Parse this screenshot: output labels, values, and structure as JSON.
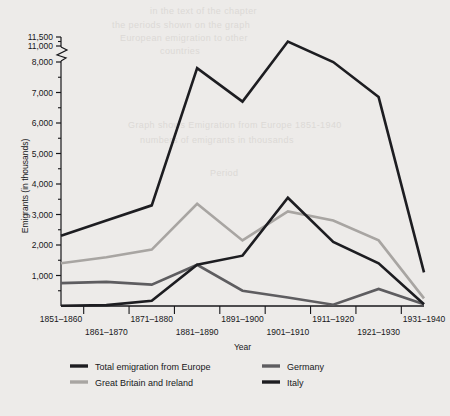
{
  "figure": {
    "background_color": "#edebe9",
    "plot_background_color": "#edebe9",
    "axis_color": "#17171a",
    "text_color": "#17171a"
  },
  "bleed_text": {
    "line1": "in the text of the chapter",
    "line2": "the periods shown on the graph",
    "line3": "European emigration to other",
    "line4": "countries",
    "line5": "Graph shows Emigration from Europe 1851-1940",
    "line6": "numbers of emigrants in thousands",
    "line7": "Period"
  },
  "chart_data": {
    "type": "line",
    "title": "",
    "xlabel": "Year",
    "ylabel": "Emigrants (in thousands)",
    "grid": false,
    "legend_position": "bottom",
    "axis_break": {
      "present": true,
      "between": [
        11000,
        8000
      ],
      "note": "y-axis is broken between 8,000 and 11,000"
    },
    "ylim": [
      0,
      11500
    ],
    "ytick_labels": [
      "1,000",
      "2,000",
      "3,000",
      "4,000",
      "5,000",
      "6,000",
      "7,000",
      "8,000",
      "11,000",
      "11,500"
    ],
    "ytick_values": [
      1000,
      2000,
      3000,
      4000,
      5000,
      6000,
      7000,
      8000,
      11000,
      11500
    ],
    "minor_ticks": [
      500,
      1500,
      2500,
      3500,
      4500,
      5500,
      6500,
      7500,
      11250
    ],
    "categories": [
      "1851–1860",
      "1861–1870",
      "1871–1880",
      "1881–1890",
      "1891–1900",
      "1901–1910",
      "1911–1920",
      "1921–1930",
      "1931–1940"
    ],
    "series": [
      {
        "name": "Total emigration from Europe",
        "color": "#1d1d21",
        "width": 2.6,
        "values": [
          2300,
          2800,
          3300,
          7800,
          6700,
          11250,
          8000,
          6850,
          1100
        ]
      },
      {
        "name": "Great Britain and Ireland",
        "color": "#a8a5a2",
        "width": 2.6,
        "values": [
          1400,
          1600,
          1850,
          3350,
          2150,
          3100,
          2800,
          2150,
          250
        ]
      },
      {
        "name": "Germany",
        "color": "#5e5d60",
        "width": 2.6,
        "values": [
          750,
          790,
          700,
          1350,
          500,
          280,
          40,
          560,
          60
        ]
      },
      {
        "name": "Italy",
        "color": "#1d1d21",
        "width": 2.6,
        "values": [
          10,
          30,
          170,
          1350,
          1650,
          3550,
          2100,
          1400,
          60
        ]
      }
    ]
  },
  "legend": {
    "items": [
      {
        "label": "Total emigration from Europe",
        "color": "#1d1d21"
      },
      {
        "label": "Great Britain and Ireland",
        "color": "#a8a5a2"
      },
      {
        "label": "Germany",
        "color": "#5e5d60"
      },
      {
        "label": "Italy",
        "color": "#1d1d21"
      }
    ]
  }
}
